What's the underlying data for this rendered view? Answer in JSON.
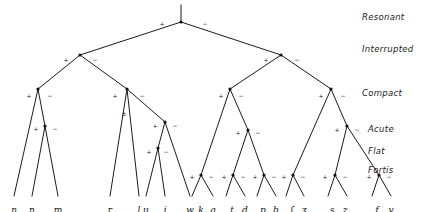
{
  "diagram": {
    "stroke_color": "#1b1b1b",
    "background_color": "#ffffff",
    "node_color": "#111111"
  },
  "feature_labels": [
    {
      "name": "resonant",
      "text": "Resonant",
      "x": 362,
      "y": 12
    },
    {
      "name": "interrupted",
      "text": "Interrupted",
      "x": 362,
      "y": 44
    },
    {
      "name": "compact",
      "text": "Compact",
      "x": 362,
      "y": 88
    },
    {
      "name": "acute",
      "text": "Acute",
      "x": 368,
      "y": 124
    },
    {
      "name": "flat",
      "text": "Flat",
      "x": 368,
      "y": 146
    },
    {
      "name": "fortis",
      "text": "Fortis",
      "x": 368,
      "y": 165
    }
  ],
  "leaves": [
    {
      "name": "leaf-eng",
      "text": "ŋ",
      "x": 14,
      "y": 205
    },
    {
      "name": "leaf-n",
      "text": "n",
      "x": 32,
      "y": 205
    },
    {
      "name": "leaf-m",
      "text": "m",
      "x": 58,
      "y": 205
    },
    {
      "name": "leaf-r",
      "text": "r",
      "x": 110,
      "y": 205
    },
    {
      "name": "leaf-l",
      "text": "l",
      "x": 139,
      "y": 205
    },
    {
      "name": "leaf-u",
      "text": "ɥ",
      "x": 146,
      "y": 205
    },
    {
      "name": "leaf-j",
      "text": "j",
      "x": 165,
      "y": 205
    },
    {
      "name": "leaf-w",
      "text": "w",
      "x": 190,
      "y": 205
    },
    {
      "name": "leaf-k",
      "text": "k",
      "x": 201,
      "y": 205
    },
    {
      "name": "leaf-g",
      "text": "g",
      "x": 213,
      "y": 205
    },
    {
      "name": "leaf-t",
      "text": "t",
      "x": 232,
      "y": 205
    },
    {
      "name": "leaf-d",
      "text": "d",
      "x": 245,
      "y": 205
    },
    {
      "name": "leaf-p",
      "text": "p",
      "x": 263,
      "y": 205
    },
    {
      "name": "leaf-b",
      "text": "b",
      "x": 276,
      "y": 205
    },
    {
      "name": "leaf-esh",
      "text": "ʃ",
      "x": 292,
      "y": 205
    },
    {
      "name": "leaf-ezh",
      "text": "ʒ",
      "x": 304,
      "y": 205
    },
    {
      "name": "leaf-s",
      "text": "s",
      "x": 332,
      "y": 205
    },
    {
      "name": "leaf-z",
      "text": "z",
      "x": 345,
      "y": 205
    },
    {
      "name": "leaf-f",
      "text": "f",
      "x": 377,
      "y": 205
    },
    {
      "name": "leaf-v",
      "text": "v",
      "x": 391,
      "y": 205
    }
  ],
  "signs": [
    {
      "name": "sign-root-plus",
      "text": "+",
      "x": 162,
      "y": 24
    },
    {
      "name": "sign-root-minus",
      "text": "−",
      "x": 205,
      "y": 24
    },
    {
      "name": "sign-int-l-plus",
      "text": "+",
      "x": 66,
      "y": 60
    },
    {
      "name": "sign-int-l-minus",
      "text": "−",
      "x": 95,
      "y": 60
    },
    {
      "name": "sign-int-r-plus",
      "text": "+",
      "x": 266,
      "y": 60
    },
    {
      "name": "sign-int-r-minus",
      "text": "−",
      "x": 297,
      "y": 60
    },
    {
      "name": "sign-cmp1-plus",
      "text": "+",
      "x": 29,
      "y": 96
    },
    {
      "name": "sign-cmp1-minus",
      "text": "−",
      "x": 50,
      "y": 96
    },
    {
      "name": "sign-cmp2-plus",
      "text": "+",
      "x": 115,
      "y": 96
    },
    {
      "name": "sign-cmp2-minus",
      "text": "−",
      "x": 142,
      "y": 96
    },
    {
      "name": "sign-cmp2-pm",
      "text": "±",
      "x": 124,
      "y": 114
    },
    {
      "name": "sign-cmp3-plus",
      "text": "+",
      "x": 221,
      "y": 96
    },
    {
      "name": "sign-cmp3-minus",
      "text": "−",
      "x": 241,
      "y": 96
    },
    {
      "name": "sign-cmp4-plus",
      "text": "+",
      "x": 321,
      "y": 96
    },
    {
      "name": "sign-cmp4-minus",
      "text": "−",
      "x": 343,
      "y": 96
    },
    {
      "name": "sign-acu1-plus",
      "text": "+",
      "x": 36,
      "y": 129
    },
    {
      "name": "sign-acu1-minus",
      "text": "−",
      "x": 55,
      "y": 129
    },
    {
      "name": "sign-acu2-plus",
      "text": "+",
      "x": 155,
      "y": 126
    },
    {
      "name": "sign-acu2-minus",
      "text": "−",
      "x": 175,
      "y": 126
    },
    {
      "name": "sign-acu3-plus",
      "text": "+",
      "x": 238,
      "y": 133
    },
    {
      "name": "sign-acu3-minus",
      "text": "−",
      "x": 258,
      "y": 133
    },
    {
      "name": "sign-acu4-plus",
      "text": "+",
      "x": 337,
      "y": 130
    },
    {
      "name": "sign-acu4-minus",
      "text": "−",
      "x": 357,
      "y": 130
    },
    {
      "name": "sign-flat-plus",
      "text": "+",
      "x": 149,
      "y": 152
    },
    {
      "name": "sign-flat-minus",
      "text": "−",
      "x": 166,
      "y": 152
    },
    {
      "name": "sign-for1-plus",
      "text": "+",
      "x": 192,
      "y": 177
    },
    {
      "name": "sign-for1-minus",
      "text": "−",
      "x": 211,
      "y": 177
    },
    {
      "name": "sign-for2-plus",
      "text": "+",
      "x": 224,
      "y": 177
    },
    {
      "name": "sign-for2-minus",
      "text": "−",
      "x": 243,
      "y": 177
    },
    {
      "name": "sign-for3-plus",
      "text": "+",
      "x": 255,
      "y": 177
    },
    {
      "name": "sign-for3-minus",
      "text": "−",
      "x": 274,
      "y": 177
    },
    {
      "name": "sign-for4-plus",
      "text": "+",
      "x": 284,
      "y": 177
    },
    {
      "name": "sign-for4-minus",
      "text": "−",
      "x": 303,
      "y": 177
    },
    {
      "name": "sign-for5-plus",
      "text": "+",
      "x": 325,
      "y": 177
    },
    {
      "name": "sign-for5-minus",
      "text": "−",
      "x": 345,
      "y": 177
    },
    {
      "name": "sign-for6-plus",
      "text": "+",
      "x": 369,
      "y": 177
    },
    {
      "name": "sign-for6-minus",
      "text": "−",
      "x": 389,
      "y": 177
    }
  ],
  "nodes": [
    {
      "name": "node-root",
      "x": 181,
      "y": 22
    },
    {
      "name": "node-interrupted-l",
      "x": 80,
      "y": 55
    },
    {
      "name": "node-interrupted-r",
      "x": 281,
      "y": 55
    },
    {
      "name": "node-compact-1",
      "x": 38,
      "y": 89
    },
    {
      "name": "node-compact-2",
      "x": 127,
      "y": 89
    },
    {
      "name": "node-compact-3",
      "x": 230,
      "y": 89
    },
    {
      "name": "node-compact-4",
      "x": 331,
      "y": 89
    },
    {
      "name": "node-acute-1",
      "x": 45,
      "y": 126
    },
    {
      "name": "node-acute-2",
      "x": 165,
      "y": 122
    },
    {
      "name": "node-acute-3",
      "x": 248,
      "y": 130
    },
    {
      "name": "node-acute-4",
      "x": 347,
      "y": 126
    },
    {
      "name": "node-flat-1",
      "x": 158,
      "y": 148
    },
    {
      "name": "node-fortis-1",
      "x": 201,
      "y": 175
    },
    {
      "name": "node-fortis-2",
      "x": 233,
      "y": 175
    },
    {
      "name": "node-fortis-3",
      "x": 264,
      "y": 175
    },
    {
      "name": "node-fortis-4",
      "x": 293,
      "y": 175
    },
    {
      "name": "node-fortis-5",
      "x": 335,
      "y": 175
    },
    {
      "name": "node-fortis-6",
      "x": 379,
      "y": 175
    }
  ],
  "edges": [
    {
      "name": "edge-root-stem",
      "x1": 181,
      "y1": 22,
      "x2": 181,
      "y2": 5
    },
    {
      "name": "edge-root-left",
      "x1": 181,
      "y1": 22,
      "x2": 80,
      "y2": 55
    },
    {
      "name": "edge-root-right",
      "x1": 181,
      "y1": 22,
      "x2": 281,
      "y2": 55
    },
    {
      "name": "edge-intl-left",
      "x1": 80,
      "y1": 55,
      "x2": 38,
      "y2": 89
    },
    {
      "name": "edge-intl-right",
      "x1": 80,
      "y1": 55,
      "x2": 127,
      "y2": 89
    },
    {
      "name": "edge-intr-left",
      "x1": 281,
      "y1": 55,
      "x2": 230,
      "y2": 89
    },
    {
      "name": "edge-intr-right",
      "x1": 281,
      "y1": 55,
      "x2": 331,
      "y2": 89
    },
    {
      "name": "edge-cmp1-left",
      "x1": 38,
      "y1": 89,
      "x2": 14,
      "y2": 196
    },
    {
      "name": "edge-cmp1-right",
      "x1": 38,
      "y1": 89,
      "x2": 45,
      "y2": 126
    },
    {
      "name": "edge-acu1-left",
      "x1": 45,
      "y1": 126,
      "x2": 32,
      "y2": 196
    },
    {
      "name": "edge-acu1-right",
      "x1": 45,
      "y1": 126,
      "x2": 58,
      "y2": 196
    },
    {
      "name": "edge-cmp2-left",
      "x1": 127,
      "y1": 89,
      "x2": 110,
      "y2": 196
    },
    {
      "name": "edge-cmp2-mid",
      "x1": 127,
      "y1": 89,
      "x2": 139,
      "y2": 196
    },
    {
      "name": "edge-cmp2-right",
      "x1": 127,
      "y1": 89,
      "x2": 165,
      "y2": 122
    },
    {
      "name": "edge-acu2-left",
      "x1": 165,
      "y1": 122,
      "x2": 158,
      "y2": 148
    },
    {
      "name": "edge-acu2-right",
      "x1": 165,
      "y1": 122,
      "x2": 190,
      "y2": 196
    },
    {
      "name": "edge-flat1-left",
      "x1": 158,
      "y1": 148,
      "x2": 146,
      "y2": 196
    },
    {
      "name": "edge-flat1-right",
      "x1": 158,
      "y1": 148,
      "x2": 165,
      "y2": 196
    },
    {
      "name": "edge-cmp3-left",
      "x1": 230,
      "y1": 89,
      "x2": 201,
      "y2": 175
    },
    {
      "name": "edge-cmp3-right",
      "x1": 230,
      "y1": 89,
      "x2": 248,
      "y2": 130
    },
    {
      "name": "edge-acu3-left",
      "x1": 248,
      "y1": 130,
      "x2": 233,
      "y2": 175
    },
    {
      "name": "edge-acu3-right",
      "x1": 248,
      "y1": 130,
      "x2": 264,
      "y2": 175
    },
    {
      "name": "edge-cmp4-left",
      "x1": 331,
      "y1": 89,
      "x2": 293,
      "y2": 175
    },
    {
      "name": "edge-cmp4-right",
      "x1": 331,
      "y1": 89,
      "x2": 347,
      "y2": 126
    },
    {
      "name": "edge-acu4-left",
      "x1": 347,
      "y1": 126,
      "x2": 335,
      "y2": 175
    },
    {
      "name": "edge-acu4-right",
      "x1": 347,
      "y1": 126,
      "x2": 379,
      "y2": 175
    },
    {
      "name": "edge-for1-left",
      "x1": 201,
      "y1": 175,
      "x2": 192,
      "y2": 196
    },
    {
      "name": "edge-for1-right",
      "x1": 201,
      "y1": 175,
      "x2": 213,
      "y2": 196
    },
    {
      "name": "edge-for2-left",
      "x1": 233,
      "y1": 175,
      "x2": 226,
      "y2": 196
    },
    {
      "name": "edge-for2-right",
      "x1": 233,
      "y1": 175,
      "x2": 245,
      "y2": 196
    },
    {
      "name": "edge-for3-left",
      "x1": 264,
      "y1": 175,
      "x2": 257,
      "y2": 196
    },
    {
      "name": "edge-for3-right",
      "x1": 264,
      "y1": 175,
      "x2": 276,
      "y2": 196
    },
    {
      "name": "edge-for4-left",
      "x1": 293,
      "y1": 175,
      "x2": 286,
      "y2": 196
    },
    {
      "name": "edge-for4-right",
      "x1": 293,
      "y1": 175,
      "x2": 304,
      "y2": 196
    },
    {
      "name": "edge-for5-left",
      "x1": 335,
      "y1": 175,
      "x2": 328,
      "y2": 196
    },
    {
      "name": "edge-for5-right",
      "x1": 335,
      "y1": 175,
      "x2": 347,
      "y2": 196
    },
    {
      "name": "edge-for6-left",
      "x1": 379,
      "y1": 175,
      "x2": 372,
      "y2": 196
    },
    {
      "name": "edge-for6-right",
      "x1": 379,
      "y1": 175,
      "x2": 391,
      "y2": 196
    }
  ]
}
